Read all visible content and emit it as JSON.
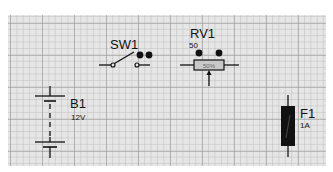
{
  "canvas": {
    "background": "#e6e6e6",
    "grid": "on"
  },
  "components": {
    "battery": {
      "ref": "B1",
      "value": "12V"
    },
    "switch": {
      "ref": "SW1",
      "state": "open"
    },
    "potentiometer": {
      "ref": "RV1",
      "value": "50",
      "wiper": "50%"
    },
    "fuse": {
      "ref": "F1",
      "value": "1A"
    }
  },
  "colors": {
    "wire": "#111111",
    "fuse_body": "#111111",
    "pot_body": "#c8c8c8"
  }
}
